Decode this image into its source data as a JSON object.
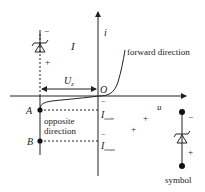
{
  "diagram": {
    "type": "zener-diode-iv-characteristic",
    "axes": {
      "vertical_label": "i",
      "horizontal_label": "u",
      "origin_label": "O"
    },
    "labels": {
      "forward": "forward direction",
      "opposite_line1": "opposite",
      "opposite_line2": "direction",
      "region_current": "I",
      "voltage_main": "U",
      "voltage_sub": "z",
      "point_a": "A",
      "point_b": "B",
      "imin_main": "I",
      "imin_sub": "zmin",
      "imax_main": "I",
      "imax_sub": "zmax",
      "symbol_caption": "symbol"
    },
    "polarity": {
      "minus": "−",
      "plus": "+"
    },
    "colors": {
      "stroke": "#222222",
      "background": "#ffffff"
    }
  }
}
